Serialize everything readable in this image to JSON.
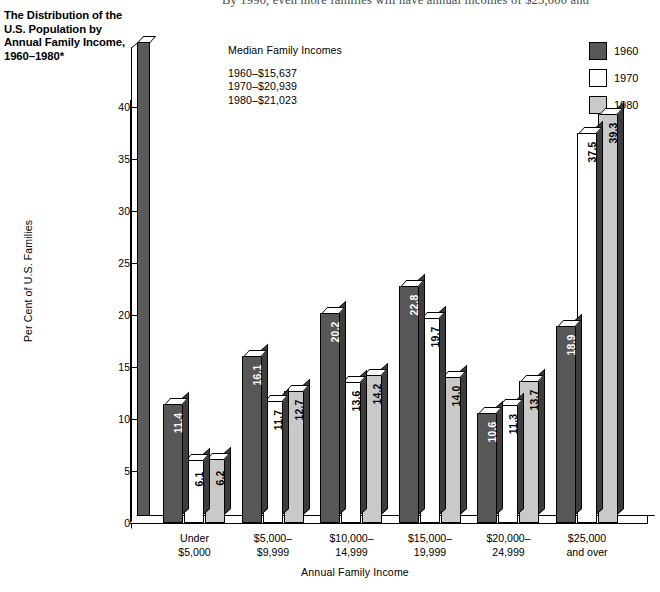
{
  "body_text": "By 1990, even more families will have annual incomes of $25,000 and",
  "figure": {
    "title": "The Distribution of the U.S. Population by Annual Family Income, 1960–1980*"
  },
  "median_box": {
    "heading": "Median Family Incomes",
    "rows": [
      "1960–$15,637",
      "1970–$20,939",
      "1980–$21,023"
    ]
  },
  "legend": {
    "items": [
      {
        "label": "1960",
        "color": "#575757"
      },
      {
        "label": "1970",
        "color": "#ffffff"
      },
      {
        "label": "1980",
        "color": "#c9c9c9"
      }
    ]
  },
  "axes": {
    "ylabel": "Per Cent of U.S. Families",
    "xlabel": "Annual Family Income",
    "yticks": [
      "0",
      "5",
      "10",
      "15",
      "20",
      "25",
      "30",
      "35",
      "40"
    ]
  },
  "chart_data": {
    "type": "bar",
    "title": "The Distribution of the U.S. Population by Annual Family Income, 1960–1980*",
    "xlabel": "Annual Family Income",
    "ylabel": "Per Cent of U.S. Families",
    "ylim": [
      0,
      42
    ],
    "ytick_step": 5,
    "grid": false,
    "legend_position": "top-right",
    "categories": [
      "Under $5,000",
      "$5,000–$9,999",
      "$10,000–14,999",
      "$15,000–19,999",
      "$20,000–24,999",
      "$25,000 and over"
    ],
    "category_lines": [
      [
        "Under",
        "$5,000"
      ],
      [
        "$5,000–",
        "$9,999"
      ],
      [
        "$10,000–",
        "14,999"
      ],
      [
        "$15,000–",
        "19,999"
      ],
      [
        "$20,000–",
        "24,999"
      ],
      [
        "$25,000",
        "and over"
      ]
    ],
    "series": [
      {
        "name": "1960",
        "color": "#575757",
        "values": [
          11.4,
          16.1,
          20.2,
          22.8,
          10.6,
          18.9
        ]
      },
      {
        "name": "1970",
        "color": "#ffffff",
        "values": [
          6.1,
          11.7,
          13.6,
          19.7,
          11.3,
          37.5
        ]
      },
      {
        "name": "1980",
        "color": "#c9c9c9",
        "values": [
          6.2,
          12.7,
          14.2,
          14.0,
          13.7,
          39.3
        ]
      }
    ],
    "annotations": {
      "median_family_incomes": {
        "1960": "$15,637",
        "1970": "$20,939",
        "1980": "$21,023"
      }
    }
  }
}
